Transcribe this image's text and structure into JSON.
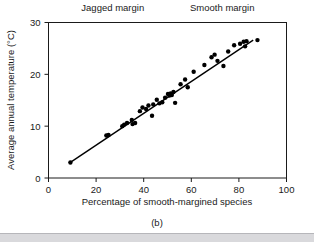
{
  "figure": {
    "caption": "(b)",
    "annotations": [
      {
        "text": "Jagged margin",
        "x_data": 27,
        "y_px": 11
      },
      {
        "text": "Smooth margin",
        "x_data": 73,
        "y_px": 11
      }
    ]
  },
  "chart_data": {
    "type": "scatter",
    "title": "",
    "xlabel": "Percentage of smooth-margined species",
    "ylabel": "Average annual temperature (°C)",
    "xlim": [
      0,
      100
    ],
    "ylim": [
      0,
      30
    ],
    "xticks": [
      0,
      20,
      40,
      60,
      80,
      100
    ],
    "yticks": [
      0,
      10,
      20,
      30
    ],
    "xtick_labels": [
      "0",
      "20",
      "40",
      "60",
      "80",
      "100"
    ],
    "ytick_labels": [
      "0",
      "10",
      "20",
      "30"
    ],
    "grid": false,
    "legend": null,
    "series": [
      {
        "name": "sites",
        "marker": "filled-circle",
        "color": "#000000",
        "points": [
          [
            9.2,
            3.0
          ],
          [
            24.3,
            8.2
          ],
          [
            25.2,
            8.3
          ],
          [
            31.0,
            10.0
          ],
          [
            31.8,
            10.3
          ],
          [
            33.0,
            10.6
          ],
          [
            35.0,
            11.2
          ],
          [
            35.3,
            10.4
          ],
          [
            36.4,
            10.6
          ],
          [
            38.4,
            12.9
          ],
          [
            39.5,
            13.6
          ],
          [
            41.0,
            13.3
          ],
          [
            42.0,
            14.0
          ],
          [
            43.5,
            12.0
          ],
          [
            44.0,
            14.2
          ],
          [
            45.5,
            15.1
          ],
          [
            46.6,
            14.4
          ],
          [
            47.8,
            14.6
          ],
          [
            49.0,
            15.5
          ],
          [
            50.2,
            16.2
          ],
          [
            50.8,
            15.9
          ],
          [
            51.3,
            16.3
          ],
          [
            51.8,
            16.0
          ],
          [
            52.5,
            16.6
          ],
          [
            53.2,
            14.5
          ],
          [
            55.5,
            18.1
          ],
          [
            57.4,
            19.0
          ],
          [
            58.5,
            17.5
          ],
          [
            61.0,
            20.5
          ],
          [
            65.5,
            21.8
          ],
          [
            68.5,
            23.3
          ],
          [
            69.8,
            23.8
          ],
          [
            71.0,
            22.6
          ],
          [
            73.5,
            21.6
          ],
          [
            75.5,
            24.4
          ],
          [
            78.0,
            25.6
          ],
          [
            80.5,
            25.9
          ],
          [
            82.0,
            26.3
          ],
          [
            82.6,
            25.4
          ],
          [
            83.2,
            26.4
          ],
          [
            87.8,
            26.6
          ]
        ]
      }
    ],
    "fit_line": {
      "name": "regression-line",
      "color": "#000000",
      "x": [
        9.2,
        86.0
      ],
      "y": [
        3.0,
        26.6
      ]
    }
  }
}
